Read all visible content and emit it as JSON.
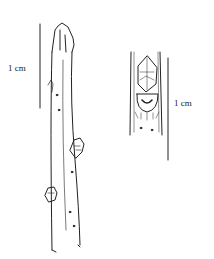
{
  "figure": {
    "left_scale": {
      "label": "1 cm"
    },
    "right_scale": {
      "label": "1 cm"
    },
    "ink_color": "#222222"
  }
}
